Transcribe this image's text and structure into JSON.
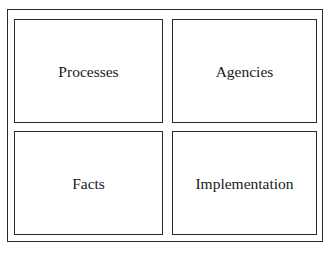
{
  "diagram": {
    "boxes": [
      {
        "label": "Processes"
      },
      {
        "label": "Agencies"
      },
      {
        "label": "Facts"
      },
      {
        "label": "Implementation"
      }
    ]
  }
}
